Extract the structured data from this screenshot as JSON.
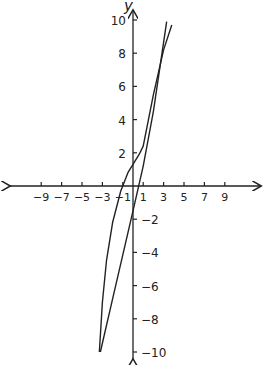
{
  "chart_data": {
    "type": "line",
    "title": "",
    "xlabel": "",
    "ylabel": "y",
    "xlim": [
      -10,
      10
    ],
    "ylim": [
      -10,
      10
    ],
    "grid": false,
    "x_ticks": [
      -9,
      -7,
      -5,
      -3,
      -1,
      1,
      3,
      5,
      7,
      9
    ],
    "x_tick_labels": [
      "−9",
      "−7",
      "−5",
      "−3",
      "−1",
      "1",
      "3",
      "5",
      "7",
      "9"
    ],
    "y_ticks": [
      10,
      8,
      6,
      4,
      2,
      -2,
      -4,
      -6,
      -8,
      -10
    ],
    "y_tick_labels": [
      "10",
      "8",
      "6",
      "4",
      "2",
      "−2",
      "−4",
      "−6",
      "−8",
      "−10"
    ],
    "series": [
      {
        "name": "line",
        "points": [
          [
            -3.2,
            -10
          ],
          [
            -2,
            -6.8
          ],
          [
            0,
            -1.5
          ],
          [
            1,
            1.2
          ],
          [
            2,
            4.5
          ],
          [
            3.3,
            9.9
          ]
        ]
      },
      {
        "name": "curve",
        "points": [
          [
            -3.3,
            -10
          ],
          [
            -3.0,
            -7
          ],
          [
            -2.6,
            -4.5
          ],
          [
            -2.0,
            -2.2
          ],
          [
            -1.2,
            -0.3
          ],
          [
            -0.5,
            0.8
          ],
          [
            0,
            1.3
          ],
          [
            0.6,
            1.9
          ],
          [
            1,
            2.4
          ],
          [
            2,
            5.5
          ],
          [
            3,
            8.2
          ],
          [
            3.8,
            9.7
          ]
        ]
      }
    ]
  }
}
